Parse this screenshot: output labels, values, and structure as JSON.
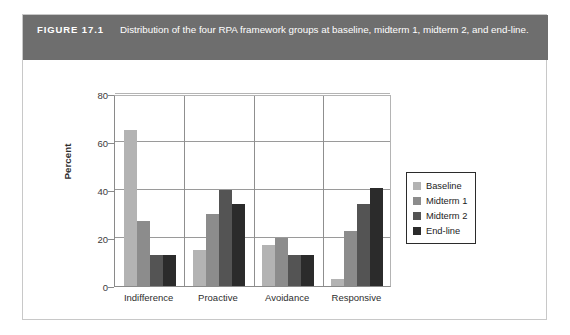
{
  "figure": {
    "number": "FIGURE 17.1",
    "caption": "Distribution of the four RPA framework groups at baseline, midterm 1, midterm 2, and end-line."
  },
  "chart_data": {
    "type": "bar",
    "title": "",
    "xlabel": "",
    "ylabel": "Percent",
    "ylim": [
      0,
      80
    ],
    "yticks": [
      0,
      20,
      40,
      60,
      80
    ],
    "ytick_labels": [
      "0",
      "20",
      "40",
      "60",
      "80"
    ],
    "grid": true,
    "legend_position": "right",
    "categories": [
      "Indifference",
      "Proactive",
      "Avoidance",
      "Responsive"
    ],
    "series": [
      {
        "name": "Baseline",
        "color": "#b3b3b3",
        "values": [
          65,
          15,
          17,
          3
        ]
      },
      {
        "name": "Midterm 1",
        "color": "#8c8c8c",
        "values": [
          27,
          30,
          20,
          23
        ]
      },
      {
        "name": "Midterm 2",
        "color": "#545454",
        "values": [
          13,
          40,
          13,
          34
        ]
      },
      {
        "name": "End-line",
        "color": "#2b2b2b",
        "values": [
          13,
          34,
          13,
          41
        ]
      }
    ]
  }
}
